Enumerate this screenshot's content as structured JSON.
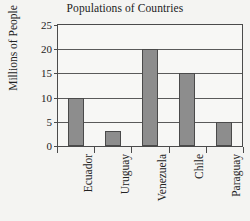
{
  "chart_data": {
    "type": "bar",
    "title": "Populations of Countries",
    "xlabel": "",
    "ylabel": "Millions of People",
    "categories": [
      "Ecuador",
      "Uruguay",
      "Venezuela",
      "Chile",
      "Paraguay"
    ],
    "values": [
      10,
      3,
      20,
      15,
      5
    ],
    "ylim": [
      0,
      25
    ],
    "yticks": [
      0,
      5,
      10,
      15,
      20,
      25
    ],
    "ytick_labels": [
      "0",
      "5",
      "10",
      "15",
      "20",
      "25"
    ],
    "grid": true,
    "legend": false,
    "bar_color": "#8d8d8d",
    "bar_edge_color": "#4a4a4a",
    "axis_color": "#4b4b4b",
    "background_color": "#f4f4f2",
    "plot_background_color": "#f7f7f5"
  }
}
